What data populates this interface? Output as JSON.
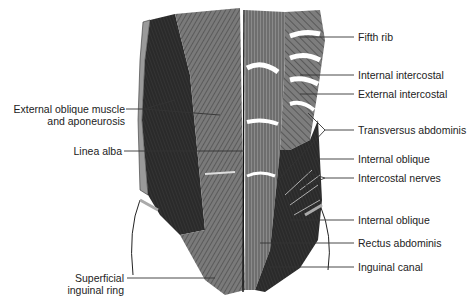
{
  "figure": {
    "labels_left": [
      {
        "id": "external-oblique",
        "line1": "External oblique muscle",
        "line2": "and aponeurosis"
      },
      {
        "id": "linea-alba",
        "line1": "Linea alba"
      },
      {
        "id": "superficial-inguinal-ring",
        "line1": "Superficial",
        "line2": "inguinal ring"
      }
    ],
    "labels_right": [
      {
        "id": "fifth-rib",
        "text": "Fifth rib"
      },
      {
        "id": "internal-intercostal",
        "text": "Internal intercostal"
      },
      {
        "id": "external-intercostal",
        "text": "External intercostal"
      },
      {
        "id": "transversus-abdominis",
        "text": "Transversus abdominis"
      },
      {
        "id": "internal-oblique-upper",
        "text": "Internal oblique"
      },
      {
        "id": "intercostal-nerves",
        "text": "Intercostal nerves"
      },
      {
        "id": "internal-oblique-lower",
        "text": "Internal oblique"
      },
      {
        "id": "rectus-abdominis",
        "text": "Rectus abdominis"
      },
      {
        "id": "inguinal-canal",
        "text": "Inguinal canal"
      }
    ],
    "colors": {
      "ink": "#222222",
      "dark_muscle": "#2a2a2a",
      "mid_muscle": "#6b6b6b",
      "light_muscle": "#9a9a9a",
      "leader_line": "#333333"
    }
  }
}
